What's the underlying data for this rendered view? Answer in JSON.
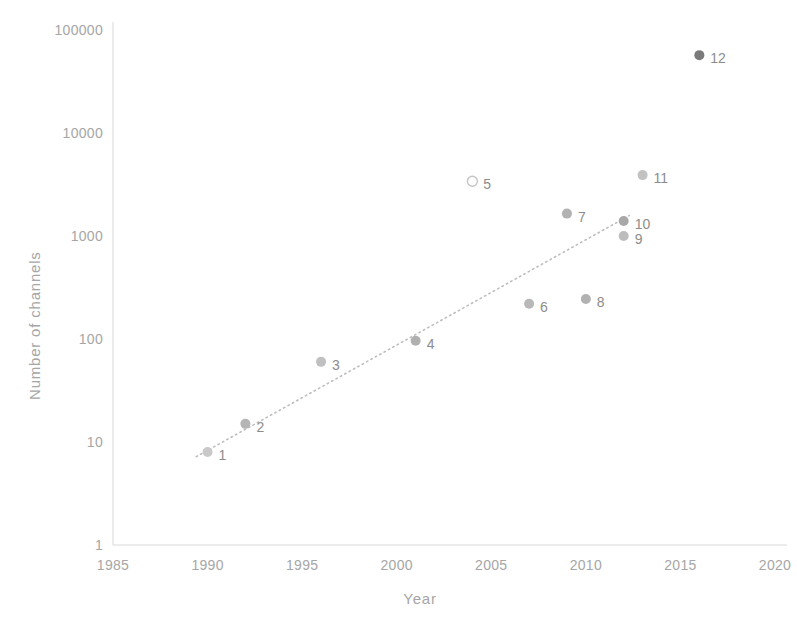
{
  "chart_data": {
    "type": "scatter",
    "title": "",
    "xlabel": "Year",
    "ylabel": "Number of channels",
    "yscale": "log",
    "xlim": [
      1985,
      2020
    ],
    "ylim": [
      1,
      100000
    ],
    "grid": false,
    "legend": "none",
    "xticks": [
      "1985",
      "1990",
      "1995",
      "2000",
      "2005",
      "2010",
      "2015",
      "2020"
    ],
    "yticks": [
      "1",
      "10",
      "100",
      "1000",
      "10000",
      "100000"
    ],
    "points": [
      {
        "label": "1",
        "x": 1990,
        "y": 8,
        "marker": "filled",
        "color": "#c9c9c9"
      },
      {
        "label": "2",
        "x": 1992,
        "y": 15,
        "marker": "filled",
        "color": "#b5b5b5"
      },
      {
        "label": "3",
        "x": 1996,
        "y": 60,
        "marker": "filled",
        "color": "#c0c0c0"
      },
      {
        "label": "4",
        "x": 2001,
        "y": 96,
        "marker": "filled",
        "color": "#b0b0b0"
      },
      {
        "label": "5",
        "x": 2004,
        "y": 3400,
        "marker": "hollow",
        "color": "#c4c4c4"
      },
      {
        "label": "6",
        "x": 2007,
        "y": 220,
        "marker": "filled",
        "color": "#b8b8b8"
      },
      {
        "label": "7",
        "x": 2009,
        "y": 1650,
        "marker": "filled",
        "color": "#b2b2b2"
      },
      {
        "label": "8",
        "x": 2010,
        "y": 245,
        "marker": "filled",
        "color": "#b2b2b2"
      },
      {
        "label": "9",
        "x": 2012,
        "y": 1000,
        "marker": "filled",
        "color": "#bdbdbd"
      },
      {
        "label": "10",
        "x": 2012,
        "y": 1400,
        "marker": "filled",
        "color": "#a8a8a8"
      },
      {
        "label": "11",
        "x": 2013,
        "y": 3900,
        "marker": "filled",
        "color": "#c2c2c2"
      },
      {
        "label": "12",
        "x": 2016,
        "y": 57000,
        "marker": "filled",
        "color": "#7a7a7a"
      }
    ],
    "trendline": {
      "style": "dotted",
      "color": "#bdbdbd",
      "x_start": 1989.4,
      "y_start": 7.2,
      "x_end": 2012.3,
      "y_end": 1580
    },
    "axis_color": "#d9d9d9"
  }
}
